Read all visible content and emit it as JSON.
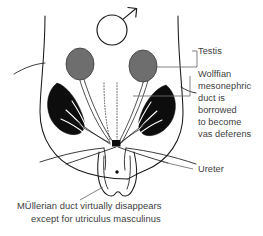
{
  "figure": {
    "symbol": "male-mars-symbol",
    "background_color": "#ffffff",
    "ink_color": "#1a1a1a",
    "text_color": "#3d3d3d",
    "gonad_color": "#6e6e6e",
    "mesonephros_color": "#0d0d0d",
    "leader_color": "#6e6e6e"
  },
  "labels": {
    "testis": "Testis",
    "wolffian": [
      "Wolffian",
      "mesonephric",
      "duct is",
      "borrowed",
      "to become",
      "vas deferens"
    ],
    "ureter": "Ureter"
  },
  "caption": {
    "line1": "MÜllerian duct virtually disappears",
    "line2": "except for utriculus masculinus"
  },
  "structures": {
    "gonad_left": "testis-left",
    "gonad_right": "testis-right",
    "mesonephros_left": "mesonephros-left",
    "mesonephros_right": "mesonephros-right",
    "mullerian_duct": "mullerian-duct-regressing",
    "urogenital_sinus": "urogenital-sinus",
    "utriculus": "utriculus-masculinus",
    "body_outline": "body-outline",
    "convergence_node": "duct-convergence-node"
  }
}
